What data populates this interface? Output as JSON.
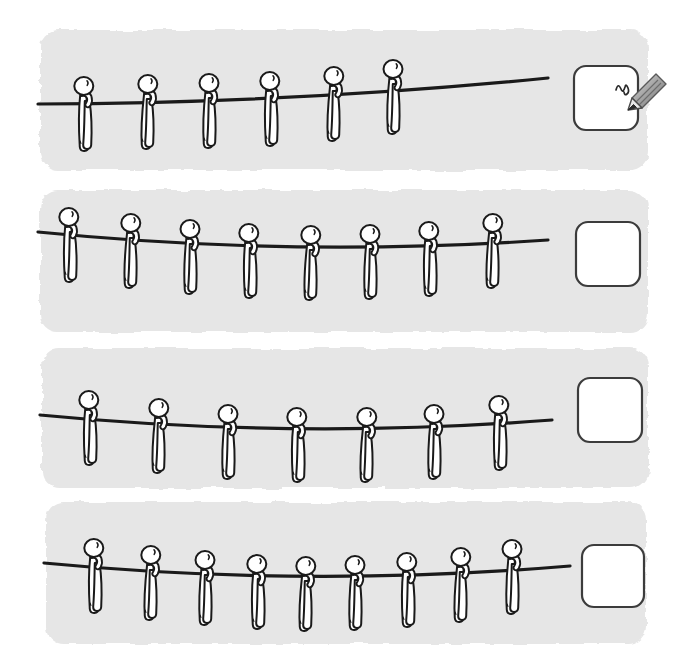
{
  "worksheet": {
    "title": "Counting figures hanging on a line",
    "type": "counting-worksheet",
    "background_color": "#ffffff",
    "panel_color": "#e6e6e6",
    "ink_color": "#1a1a1a",
    "answer_box_fill": "#ffffff",
    "answer_box_border": "#3c3c3c",
    "pencil_color": "#9a9a9a",
    "rows": [
      {
        "index": 1,
        "name": "row-1",
        "figure_count": 6,
        "answer_value": "",
        "answer_placeholder": "",
        "has_pencil": true,
        "panel": {
          "x": 40,
          "y": 30,
          "width": 608,
          "height": 140
        },
        "line": {
          "left_y": 104,
          "mid_y": 100,
          "right_y": 78,
          "end_x": 548
        },
        "figure_xs": [
          85,
          147,
          209,
          271,
          333,
          393
        ],
        "figure_line_ys": [
          103,
          101,
          100,
          98,
          93,
          86
        ],
        "box": {
          "x": 574,
          "y": 66,
          "size": 64
        },
        "pencil": {
          "x": 630,
          "y": 82
        }
      },
      {
        "index": 2,
        "name": "row-2",
        "figure_count": 8,
        "answer_value": "",
        "answer_placeholder": "",
        "has_pencil": false,
        "panel": {
          "x": 40,
          "y": 190,
          "width": 608,
          "height": 142
        },
        "line": {
          "left_y": 232,
          "mid_y": 252,
          "right_y": 240,
          "end_x": 548
        },
        "figure_xs": [
          70,
          130,
          190,
          250,
          310,
          370,
          430,
          492
        ],
        "figure_line_ys": [
          234,
          240,
          246,
          250,
          252,
          251,
          248,
          240
        ],
        "box": {
          "x": 576,
          "y": 222,
          "size": 64
        },
        "pencil": null
      },
      {
        "index": 3,
        "name": "row-3",
        "figure_count": 7,
        "answer_value": "",
        "answer_placeholder": "",
        "has_pencil": false,
        "panel": {
          "x": 42,
          "y": 348,
          "width": 606,
          "height": 140
        },
        "line": {
          "left_y": 415,
          "mid_y": 434,
          "right_y": 420,
          "end_x": 552
        },
        "figure_xs": [
          90,
          158,
          228,
          298,
          366,
          434,
          500
        ],
        "figure_line_ys": [
          417,
          425,
          431,
          434,
          434,
          431,
          422
        ],
        "box": {
          "x": 578,
          "y": 378,
          "size": 64
        },
        "pencil": null
      },
      {
        "index": 4,
        "name": "row-4",
        "figure_count": 9,
        "answer_value": "",
        "answer_placeholder": "",
        "has_pencil": false,
        "panel": {
          "x": 46,
          "y": 502,
          "width": 600,
          "height": 142
        },
        "line": {
          "left_y": 563,
          "mid_y": 582,
          "right_y": 566,
          "end_x": 570
        },
        "figure_xs": [
          95,
          150,
          205,
          258,
          305,
          355,
          408,
          460,
          512
        ],
        "figure_line_ys": [
          565,
          572,
          577,
          581,
          583,
          582,
          579,
          574,
          566
        ],
        "box": {
          "x": 582,
          "y": 545,
          "size": 62
        },
        "pencil": null
      }
    ]
  }
}
